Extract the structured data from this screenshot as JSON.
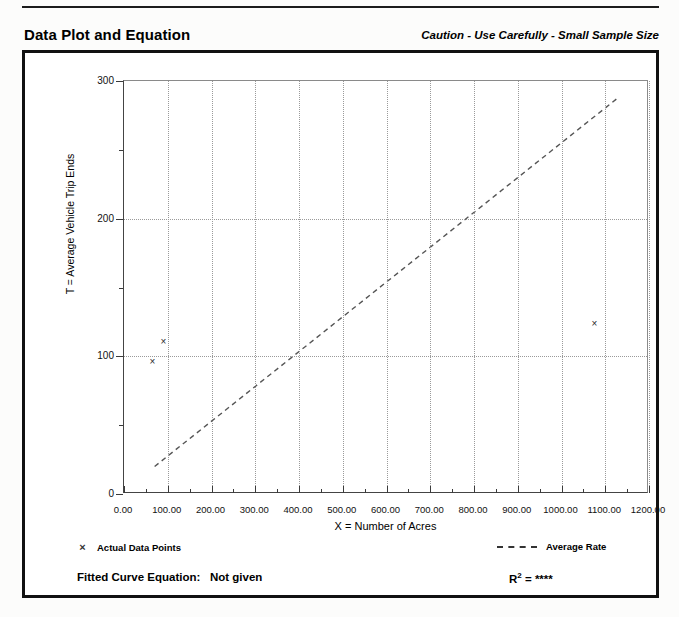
{
  "header": {
    "title": "Data Plot and Equation",
    "caution": "Caution - Use Carefully - Small Sample Size"
  },
  "legend": {
    "data_points_label": "Actual Data Points",
    "data_points_marker": "x-marker-icon",
    "average_rate_label": "Average Rate",
    "average_rate_marker": "dashed-line-icon"
  },
  "footer": {
    "fitted_curve_label": "Fitted Curve Equation:",
    "fitted_curve_value": "Not given",
    "r2_label": "R",
    "r2_exponent": "2",
    "r2_equals": "=",
    "r2_value": "****"
  },
  "colors": {
    "ink": "#111111",
    "grid": "#9a9a9a",
    "axis": "#3a3a3a",
    "marker": "#2a2a2a",
    "page": "#ffffff"
  },
  "chart_data": {
    "type": "scatter",
    "title": "Data Plot and Equation",
    "xlabel": "X = Number of Acres",
    "ylabel": "T = Average Vehicle Trip Ends",
    "xlim": [
      0,
      1200
    ],
    "ylim": [
      0,
      300
    ],
    "grid": true,
    "legend_position": "below-plot",
    "xticks": [
      0,
      100,
      200,
      300,
      400,
      500,
      600,
      700,
      800,
      900,
      1000,
      1100,
      1200
    ],
    "xticklabels": [
      "0.00",
      "100.00",
      "200.00",
      "300.00",
      "400.00",
      "500.00",
      "600.00",
      "700.00",
      "800.00",
      "900.00",
      "1000.00",
      "1100.00",
      "1200.00"
    ],
    "xminorticks": [
      50,
      150,
      250,
      350,
      450,
      550,
      650,
      750,
      850,
      950,
      1050,
      1150
    ],
    "yticks": [
      0,
      100,
      200,
      300
    ],
    "yticklabels": [
      "0",
      "100",
      "200",
      "300"
    ],
    "yminorticks": [
      50,
      150,
      250
    ],
    "series": [
      {
        "name": "Actual Data Points",
        "type": "scatter",
        "marker": "x",
        "points": [
          {
            "x": 65,
            "y": 96
          },
          {
            "x": 90,
            "y": 111
          },
          {
            "x": 1075,
            "y": 124
          }
        ]
      },
      {
        "name": "Average Rate",
        "type": "line",
        "style": "dashed",
        "points": [
          {
            "x": 70,
            "y": 20
          },
          {
            "x": 1130,
            "y": 288
          }
        ]
      }
    ]
  }
}
